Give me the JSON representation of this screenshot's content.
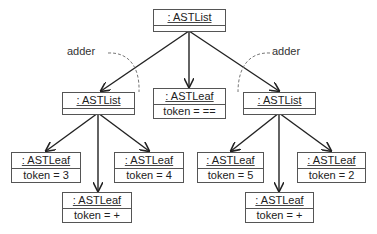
{
  "diagram": {
    "type": "uml-object-diagram",
    "nodes": {
      "root": {
        "name": ": ASTList",
        "attr": ""
      },
      "left_list": {
        "name": ": ASTList",
        "attr": ""
      },
      "middle_leaf": {
        "name": ": ASTLeaf",
        "attr": "token = =="
      },
      "right_list": {
        "name": ": ASTList",
        "attr": ""
      },
      "leaf_3": {
        "name": ": ASTLeaf",
        "attr": "token = 3"
      },
      "leaf_4": {
        "name": ": ASTLeaf",
        "attr": "token = 4"
      },
      "leaf_plus_left": {
        "name": ": ASTLeaf",
        "attr": "token = +"
      },
      "leaf_5": {
        "name": ": ASTLeaf",
        "attr": "token = 5"
      },
      "leaf_2": {
        "name": ": ASTLeaf",
        "attr": "token = 2"
      },
      "leaf_plus_right": {
        "name": ": ASTLeaf",
        "attr": "token = +"
      }
    },
    "labels": {
      "adder_left": "adder",
      "adder_right": "adder"
    },
    "edges": [
      [
        "root",
        "left_list"
      ],
      [
        "root",
        "middle_leaf"
      ],
      [
        "root",
        "right_list"
      ],
      [
        "left_list",
        "leaf_3"
      ],
      [
        "left_list",
        "leaf_plus_left"
      ],
      [
        "left_list",
        "leaf_4"
      ],
      [
        "right_list",
        "leaf_5"
      ],
      [
        "right_list",
        "leaf_plus_right"
      ],
      [
        "right_list",
        "leaf_2"
      ]
    ]
  }
}
